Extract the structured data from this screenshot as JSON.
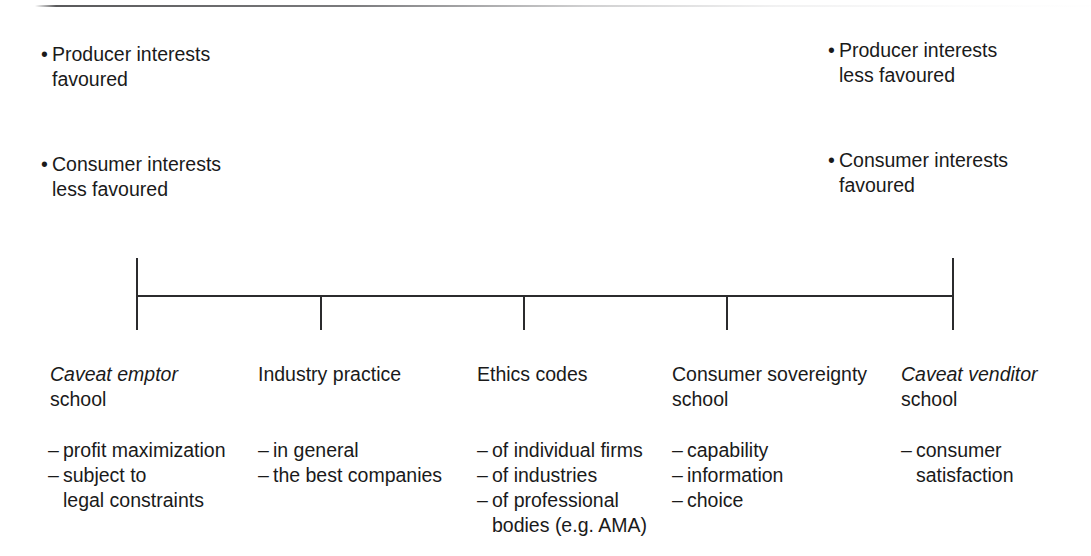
{
  "figure": {
    "scale_endpoints": {
      "left": {
        "bullets": [
          {
            "line1": "Producer interests",
            "line2": "favoured"
          },
          {
            "line1": "Consumer interests",
            "line2": "less favoured"
          }
        ]
      },
      "right": {
        "bullets": [
          {
            "line1": "Producer interests",
            "line2": "less favoured"
          },
          {
            "line1": "Consumer interests",
            "line2": "favoured"
          }
        ]
      }
    },
    "bullet_marker": "•",
    "dash_marker": "–",
    "axis": {
      "tick_count": 5,
      "line_color": "#2b2b2d"
    },
    "columns": [
      {
        "title": "Caveat emptor",
        "title_italic": true,
        "subtitle": "school",
        "details": [
          {
            "text": "profit maximization"
          },
          {
            "text": "subject to",
            "continuation": "legal constraints"
          }
        ]
      },
      {
        "title": "Industry practice",
        "title_italic": false,
        "subtitle": "",
        "details": [
          {
            "text": "in general"
          },
          {
            "text": "the best companies"
          }
        ]
      },
      {
        "title": "Ethics codes",
        "title_italic": false,
        "subtitle": "",
        "details": [
          {
            "text": "of individual firms"
          },
          {
            "text": "of industries"
          },
          {
            "text": "of professional",
            "continuation": "bodies (e.g. AMA)"
          }
        ]
      },
      {
        "title": "Consumer sovereignty",
        "title_italic": false,
        "subtitle": "school",
        "details": [
          {
            "text": "capability"
          },
          {
            "text": "information"
          },
          {
            "text": "choice"
          }
        ]
      },
      {
        "title": "Caveat venditor",
        "title_italic": true,
        "subtitle": "school",
        "details": [
          {
            "text": "consumer",
            "continuation": "satisfaction"
          }
        ]
      }
    ]
  }
}
